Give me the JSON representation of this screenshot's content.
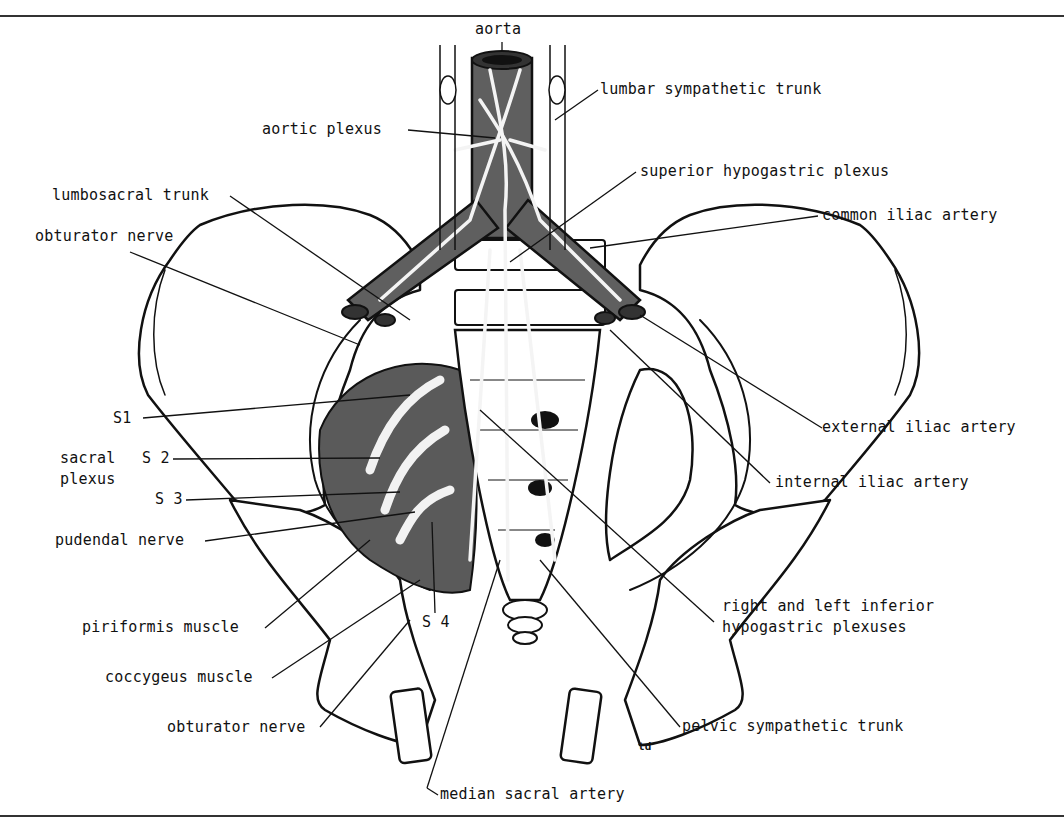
{
  "figure": {
    "type": "anatomical-illustration",
    "colors": {
      "artery": "#5f5f5f",
      "muscle": "#5a5a5a",
      "ink": "#111111",
      "nerve": "#f2f2f2",
      "paper": "#ffffff"
    },
    "artist_mark": "td"
  },
  "labels": {
    "aorta": "aorta",
    "lumbar_sympathetic_trunk": "lumbar sympathetic trunk",
    "aortic_plexus": "aortic plexus",
    "superior_hypogastric_plexus": "superior hypogastric plexus",
    "lumbosacral_trunk": "lumbosacral trunk",
    "common_iliac_artery": "common iliac artery",
    "obturator_nerve_upper": "obturator nerve",
    "s1": "S1",
    "sacral_plexus_line1": "sacral",
    "sacral_plexus_line2": "plexus",
    "s2": "S 2",
    "s3": "S 3",
    "pudendal_nerve": "pudendal nerve",
    "piriformis_muscle": "piriformis muscle",
    "s4": "S 4",
    "coccygeus_muscle": "coccygeus muscle",
    "obturator_nerve_lower": "obturator nerve",
    "median_sacral_artery": "median sacral artery",
    "external_iliac_artery": "external iliac artery",
    "internal_iliac_artery": "internal iliac artery",
    "inferior_hypogastric_line1": "right and left inferior",
    "inferior_hypogastric_line2": "hypogastric plexuses",
    "pelvic_sympathetic_trunk": "pelvic sympathetic trunk",
    "artist_mark": "td"
  }
}
